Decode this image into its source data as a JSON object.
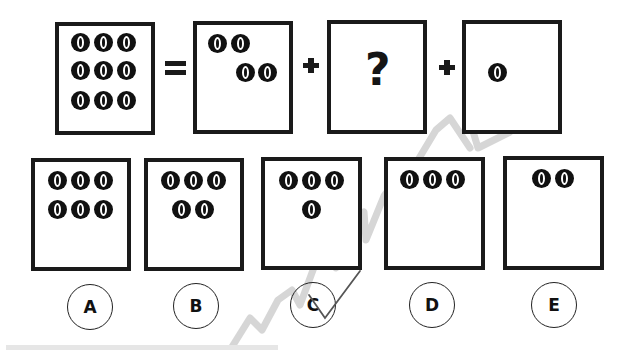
{
  "puzzle": {
    "equation": {
      "total": {
        "coin_count": 9,
        "coins": [
          [
            80,
            42
          ],
          [
            103,
            42
          ],
          [
            126,
            42
          ],
          [
            80,
            70
          ],
          [
            103,
            70
          ],
          [
            126,
            70
          ],
          [
            80,
            100
          ],
          [
            103,
            100
          ],
          [
            126,
            100
          ]
        ]
      },
      "equals_symbol": "=",
      "plus_symbol": "+",
      "part1": {
        "coin_count": 4,
        "coins": [
          [
            217,
            43
          ],
          [
            240,
            43
          ],
          [
            245,
            72
          ],
          [
            267,
            72
          ]
        ]
      },
      "part2": {
        "unknown_symbol": "?"
      },
      "part3": {
        "coin_count": 1,
        "coins": [
          [
            497,
            72
          ]
        ]
      }
    },
    "options": [
      {
        "label": "A",
        "coin_count": 6,
        "coins": [
          [
            57,
            180
          ],
          [
            80,
            180
          ],
          [
            103,
            180
          ],
          [
            57,
            209
          ],
          [
            80,
            209
          ],
          [
            103,
            209
          ]
        ]
      },
      {
        "label": "B",
        "coin_count": 5,
        "coins": [
          [
            170,
            180
          ],
          [
            193,
            180
          ],
          [
            216,
            180
          ],
          [
            181,
            209
          ],
          [
            204,
            209
          ]
        ]
      },
      {
        "label": "C",
        "coin_count": 4,
        "coins": [
          [
            288,
            180
          ],
          [
            311,
            180
          ],
          [
            334,
            180
          ],
          [
            311,
            209
          ]
        ]
      },
      {
        "label": "D",
        "coin_count": 3,
        "coins": [
          [
            409,
            179
          ],
          [
            432,
            179
          ],
          [
            455,
            179
          ]
        ]
      },
      {
        "label": "E",
        "coin_count": 2,
        "coins": [
          [
            541,
            178
          ],
          [
            564,
            178
          ]
        ]
      }
    ],
    "marked_answer": "C",
    "colors": {
      "ink": "#1a1a1a",
      "watermark": "#c8c8c8",
      "check_mark": "#555555"
    }
  }
}
